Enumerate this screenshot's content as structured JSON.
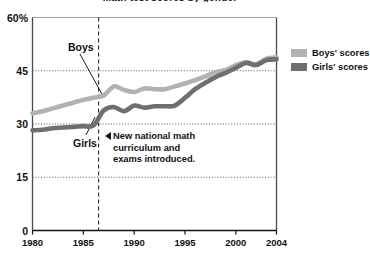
{
  "title": "Math test scores by gender",
  "legend": {
    "items": [
      {
        "label": "Boys' scores",
        "color": "#b2b2b2",
        "name": "boys"
      },
      {
        "label": "Girls' scores",
        "color": "#6f6f6f",
        "name": "girls"
      }
    ]
  },
  "annotation": {
    "arrow": "left-triangle",
    "line1": "New national math",
    "line2": "curriculum and",
    "line3": "exams introduced."
  },
  "series_labels": {
    "boys": "Boys",
    "girls": "Girls"
  },
  "chart_data": {
    "type": "line",
    "title": "Math test scores by gender",
    "xlabel": "",
    "ylabel": "",
    "xlim": [
      1980,
      2004
    ],
    "ylim": [
      0,
      60
    ],
    "yticks": [
      0,
      15,
      30,
      45,
      60
    ],
    "ytick_labels": [
      "0",
      "15",
      "30",
      "45",
      "60%"
    ],
    "xticks": [
      1980,
      1985,
      1990,
      1995,
      2000,
      2004
    ],
    "xtick_labels": [
      "1980",
      "1985",
      "1990",
      "1995",
      "2000",
      "2004"
    ],
    "grid": "horizontal-dotted",
    "legend_position": "right",
    "annotations": [
      {
        "type": "vline",
        "x": 1986.5,
        "style": "dashed",
        "text": "New national math curriculum and exams introduced."
      }
    ],
    "x": [
      1980,
      1981,
      1982,
      1983,
      1984,
      1985,
      1986,
      1987,
      1988,
      1989,
      1990,
      1991,
      1992,
      1993,
      1994,
      1995,
      1996,
      1997,
      1998,
      1999,
      2000,
      2001,
      2002,
      2003,
      2004
    ],
    "series": [
      {
        "name": "Boys' scores",
        "color": "#b2b2b2",
        "values": [
          33.0,
          33.6,
          34.4,
          35.2,
          36.0,
          36.8,
          37.4,
          38.0,
          40.6,
          39.6,
          39.0,
          40.0,
          39.8,
          39.8,
          40.6,
          41.4,
          42.4,
          43.4,
          44.6,
          45.2,
          46.6,
          47.4,
          46.8,
          48.4,
          48.8
        ]
      },
      {
        "name": "Girls' scores",
        "color": "#6f6f6f",
        "values": [
          28.2,
          28.4,
          28.8,
          29.0,
          29.2,
          29.4,
          29.6,
          33.8,
          34.8,
          33.6,
          35.2,
          34.6,
          35.0,
          35.0,
          35.2,
          37.4,
          39.8,
          41.6,
          43.2,
          44.4,
          45.8,
          47.2,
          46.6,
          48.0,
          48.2
        ]
      }
    ]
  }
}
